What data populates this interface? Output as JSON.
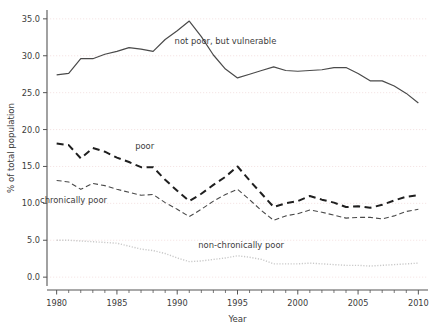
{
  "chart_data": {
    "type": "line",
    "title": "",
    "xlabel": "Year",
    "ylabel": "% of total population",
    "xlim": [
      1979.2,
      2010.8
    ],
    "ylim": [
      -1.2,
      36.2
    ],
    "xticks": [
      1980,
      1985,
      1990,
      1995,
      2000,
      2005,
      2010
    ],
    "xtick_labels": [
      "1980",
      "1985",
      "1990",
      "1995",
      "2000",
      "2005",
      "2010"
    ],
    "xminor_step": 1,
    "yticks": [
      0,
      5,
      10,
      15,
      20,
      25,
      30,
      35
    ],
    "ytick_labels": [
      "0.0",
      "5.0",
      "10.0",
      "15.0",
      "20.0",
      "25.0",
      "30.0",
      "35.0"
    ],
    "grid": "y-only-dotted",
    "legend_position": "inline-annotations",
    "x": [
      1980,
      1981,
      1982,
      1983,
      1984,
      1985,
      1986,
      1987,
      1988,
      1989,
      1990,
      1991,
      1992,
      1993,
      1994,
      1995,
      1996,
      1997,
      1998,
      1999,
      2000,
      2001,
      2002,
      2003,
      2004,
      2005,
      2006,
      2007,
      2008,
      2009,
      2010
    ],
    "series": [
      {
        "name": "not poor, but vulnerable",
        "style": "solid",
        "color": "#4a4a4a",
        "width": 1.2,
        "label_x": 1994.0,
        "label_y": 31.6,
        "values": [
          27.4,
          27.6,
          29.6,
          29.6,
          30.2,
          30.6,
          31.1,
          30.9,
          30.6,
          32.2,
          33.4,
          34.7,
          32.6,
          30.1,
          28.2,
          27.0,
          27.5,
          28.0,
          28.5,
          28.0,
          27.9,
          28.0,
          28.1,
          28.4,
          28.4,
          27.6,
          26.6,
          26.6,
          25.9,
          24.9,
          23.6
        ]
      },
      {
        "name": "poor",
        "style": "dashed-thick",
        "color": "#1f1f1f",
        "width": 2.0,
        "label_x": 1987.3,
        "label_y": 17.3,
        "values": [
          18.1,
          17.9,
          16.1,
          17.5,
          17.0,
          16.2,
          15.6,
          14.9,
          14.9,
          13.2,
          11.7,
          10.3,
          11.3,
          12.5,
          13.6,
          15.0,
          13.1,
          11.3,
          9.5,
          10.0,
          10.3,
          11.0,
          10.5,
          10.1,
          9.5,
          9.6,
          9.4,
          9.8,
          10.4,
          10.9,
          11.1
        ]
      },
      {
        "name": "chronically poor",
        "style": "dashed-thin",
        "color": "#4a4a4a",
        "width": 1.1,
        "label_x": 1981.4,
        "label_y": 10.0,
        "values": [
          13.1,
          12.9,
          11.9,
          12.7,
          12.4,
          11.9,
          11.5,
          11.1,
          11.2,
          10.1,
          9.2,
          8.2,
          9.2,
          10.3,
          11.2,
          11.9,
          10.5,
          9.0,
          7.7,
          8.3,
          8.6,
          9.1,
          8.8,
          8.4,
          8.0,
          8.1,
          8.1,
          7.9,
          8.3,
          8.9,
          9.2
        ]
      },
      {
        "name": "non-chronically poor",
        "style": "dotted",
        "color": "#c9c9c9",
        "width": 1.4,
        "label_x": 1995.3,
        "label_y": 3.9,
        "values": [
          5.0,
          5.0,
          4.9,
          4.8,
          4.7,
          4.6,
          4.2,
          3.8,
          3.6,
          3.2,
          2.6,
          2.1,
          2.2,
          2.4,
          2.6,
          2.9,
          2.7,
          2.4,
          1.8,
          1.8,
          1.8,
          1.9,
          1.8,
          1.7,
          1.6,
          1.6,
          1.5,
          1.6,
          1.7,
          1.8,
          1.9
        ]
      }
    ]
  }
}
